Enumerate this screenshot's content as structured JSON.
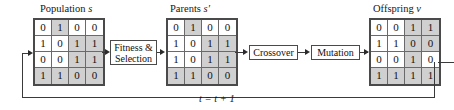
{
  "figure": {
    "loop_label": "t = t + 1"
  },
  "matrices": [
    {
      "id": "population",
      "caption_text": "Population",
      "caption_symbol": "s",
      "rows": [
        {
          "cells": [
            {
              "v": "0",
              "shaded": false
            },
            {
              "v": "1",
              "shaded": true
            },
            {
              "v": "0",
              "shaded": false
            },
            {
              "v": "0",
              "shaded": false
            }
          ]
        },
        {
          "cells": [
            {
              "v": "1",
              "shaded": false
            },
            {
              "v": "0",
              "shaded": false
            },
            {
              "v": "1",
              "shaded": true
            },
            {
              "v": "1",
              "shaded": true
            }
          ]
        },
        {
          "cells": [
            {
              "v": "0",
              "shaded": false
            },
            {
              "v": "0",
              "shaded": false
            },
            {
              "v": "1",
              "shaded": true
            },
            {
              "v": "1",
              "shaded": true
            }
          ]
        },
        {
          "cells": [
            {
              "v": "1",
              "shaded": true
            },
            {
              "v": "1",
              "shaded": true
            },
            {
              "v": "0",
              "shaded": true
            },
            {
              "v": "0",
              "shaded": true
            }
          ]
        }
      ]
    },
    {
      "id": "parents",
      "caption_text": "Parents",
      "caption_symbol": "s′",
      "rows": [
        {
          "cells": [
            {
              "v": "0",
              "shaded": false
            },
            {
              "v": "1",
              "shaded": true
            },
            {
              "v": "0",
              "shaded": false
            },
            {
              "v": "0",
              "shaded": false
            }
          ]
        },
        {
          "cells": [
            {
              "v": "1",
              "shaded": false
            },
            {
              "v": "0",
              "shaded": false
            },
            {
              "v": "1",
              "shaded": true
            },
            {
              "v": "1",
              "shaded": true
            }
          ]
        },
        {
          "cells": [
            {
              "v": "1",
              "shaded": false
            },
            {
              "v": "0",
              "shaded": false
            },
            {
              "v": "1",
              "shaded": true
            },
            {
              "v": "1",
              "shaded": true
            }
          ]
        },
        {
          "cells": [
            {
              "v": "1",
              "shaded": true
            },
            {
              "v": "1",
              "shaded": true
            },
            {
              "v": "0",
              "shaded": true
            },
            {
              "v": "0",
              "shaded": true
            }
          ]
        }
      ]
    },
    {
      "id": "offspring",
      "caption_text": "Offspring",
      "caption_symbol": "v",
      "rows": [
        {
          "cells": [
            {
              "v": "0",
              "shaded": false
            },
            {
              "v": "0",
              "shaded": false
            },
            {
              "v": "1",
              "shaded": true
            },
            {
              "v": "1",
              "shaded": true
            }
          ]
        },
        {
          "cells": [
            {
              "v": "1",
              "shaded": false
            },
            {
              "v": "1",
              "shaded": false
            },
            {
              "v": "0",
              "shaded": true
            },
            {
              "v": "0",
              "shaded": true
            }
          ]
        },
        {
          "cells": [
            {
              "v": "0",
              "shaded": false
            },
            {
              "v": "0",
              "shaded": false
            },
            {
              "v": "1",
              "shaded": true
            },
            {
              "v": "0",
              "shaded": false
            }
          ]
        },
        {
          "cells": [
            {
              "v": "1",
              "shaded": true
            },
            {
              "v": "1",
              "shaded": true
            },
            {
              "v": "1",
              "shaded": true
            },
            {
              "v": "1",
              "shaded": true
            }
          ]
        }
      ]
    }
  ],
  "process_boxes": [
    {
      "id": "fitness-selection",
      "line1": "Fitness &",
      "line2": "Selection"
    },
    {
      "id": "crossover",
      "line1": "Crossover",
      "line2": ""
    },
    {
      "id": "mutation",
      "line1": "Mutation",
      "line2": ""
    }
  ]
}
